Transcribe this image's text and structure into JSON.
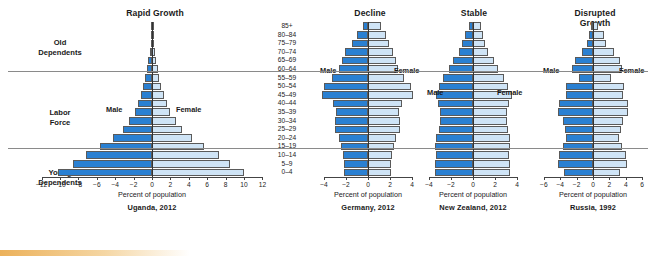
{
  "figure": {
    "axis_label": "Percent of population",
    "male_label": "Male",
    "female_label": "Female",
    "age_groups": [
      "85+",
      "80–84",
      "75–79",
      "70–74",
      "65–69",
      "60–64",
      "55–59",
      "50–54",
      "45–49",
      "40–44",
      "35–39",
      "30–34",
      "25–29",
      "20–24",
      "15–19",
      "10–14",
      "5–9",
      "0–4"
    ],
    "side_labels": [
      {
        "line1": "Old",
        "line2": "Dependents"
      },
      {
        "line1": "Labor",
        "line2": "Force"
      },
      {
        "line1": "Young",
        "line2": "Dependents"
      }
    ],
    "colors": {
      "male": "#2a80d2",
      "female": "#cfe4f6",
      "outline": "#5a5a5a",
      "divider": "#8a8a8a"
    }
  },
  "chart_data": [
    {
      "type": "bar",
      "title": "Rapid Growth",
      "caption": "Uganda, 2012",
      "xlabel": "Percent of population",
      "ylabel": "",
      "xlim": [
        -12,
        12
      ],
      "xticks": [
        -12,
        -10,
        -8,
        -6,
        -4,
        -2,
        0,
        2,
        4,
        6,
        8,
        10,
        12
      ],
      "ticklabels": [
        "−12",
        "−10",
        "−8",
        "−6",
        "−4",
        "−2",
        "0",
        "2",
        "4",
        "6",
        "8",
        "10",
        "12"
      ],
      "categories": [
        "85+",
        "80–84",
        "75–79",
        "70–74",
        "65–69",
        "60–64",
        "55–59",
        "50–54",
        "45–49",
        "40–44",
        "35–39",
        "30–34",
        "25–29",
        "20–24",
        "15–19",
        "10–14",
        "5–9",
        "0–4"
      ],
      "series": [
        {
          "name": "Male",
          "values": [
            0.05,
            0.1,
            0.15,
            0.25,
            0.4,
            0.55,
            0.75,
            0.95,
            1.2,
            1.5,
            1.9,
            2.5,
            3.2,
            4.2,
            5.6,
            7.2,
            8.6,
            10.2
          ]
        },
        {
          "name": "Female",
          "values": [
            0.05,
            0.12,
            0.18,
            0.3,
            0.45,
            0.6,
            0.8,
            1.0,
            1.3,
            1.6,
            2.0,
            2.6,
            3.3,
            4.3,
            5.7,
            7.3,
            8.5,
            10.0
          ]
        }
      ],
      "legend": [
        "Male",
        "Female"
      ]
    },
    {
      "type": "bar",
      "title": "Decline",
      "caption": "Germany, 2012",
      "xlabel": "Percent of population",
      "ylabel": "",
      "xlim": [
        -4,
        4
      ],
      "xticks": [
        -4,
        -2,
        0,
        2,
        4
      ],
      "ticklabels": [
        "−4",
        "−2",
        "0",
        "2",
        "4"
      ],
      "categories": [
        "85+",
        "80–84",
        "75–79",
        "70–74",
        "65–69",
        "60–64",
        "55–59",
        "50–54",
        "45–49",
        "40–44",
        "35–39",
        "30–34",
        "25–29",
        "20–24",
        "15–19",
        "10–14",
        "5–9",
        "0–4"
      ],
      "series": [
        {
          "name": "Male",
          "values": [
            0.5,
            1.0,
            1.5,
            2.1,
            2.4,
            2.6,
            3.3,
            4.0,
            4.2,
            3.2,
            2.9,
            3.0,
            3.0,
            2.6,
            2.5,
            2.3,
            2.2,
            2.2
          ]
        },
        {
          "name": "Female",
          "values": [
            1.2,
            1.6,
            1.9,
            2.3,
            2.5,
            2.7,
            3.3,
            3.9,
            4.1,
            3.1,
            2.8,
            2.9,
            2.9,
            2.5,
            2.4,
            2.2,
            2.1,
            2.1
          ]
        }
      ],
      "legend": [
        "Male",
        "Female"
      ]
    },
    {
      "type": "bar",
      "title": "Stable",
      "caption": "New Zealand, 2012",
      "xlabel": "Percent of population",
      "ylabel": "",
      "xlim": [
        -4,
        4
      ],
      "xticks": [
        -4,
        -2,
        0,
        2,
        4
      ],
      "ticklabels": [
        "−4",
        "−2",
        "0",
        "2",
        "4"
      ],
      "categories": [
        "85+",
        "80–84",
        "75–79",
        "70–74",
        "65–69",
        "60–64",
        "55–59",
        "50–54",
        "45–49",
        "40–44",
        "35–39",
        "30–34",
        "25–29",
        "20–24",
        "15–19",
        "10–14",
        "5–9",
        "0–4"
      ],
      "series": [
        {
          "name": "Male",
          "values": [
            0.4,
            0.7,
            1.0,
            1.3,
            1.8,
            2.2,
            2.7,
            3.1,
            3.4,
            3.2,
            3.0,
            3.0,
            3.1,
            3.4,
            3.5,
            3.4,
            3.5,
            3.5
          ]
        },
        {
          "name": "Female",
          "values": [
            0.7,
            0.9,
            1.1,
            1.4,
            1.9,
            2.3,
            2.8,
            3.2,
            3.5,
            3.3,
            3.1,
            3.1,
            3.2,
            3.4,
            3.4,
            3.3,
            3.4,
            3.4
          ]
        }
      ],
      "legend": [
        "Male",
        "Female"
      ]
    },
    {
      "type": "bar",
      "title": "Disrupted Growth",
      "caption": "Russia, 1992",
      "xlabel": "Percent of population",
      "ylabel": "",
      "xlim": [
        -6,
        6
      ],
      "xticks": [
        -6,
        -4,
        -2,
        0,
        2,
        4,
        6
      ],
      "ticklabels": [
        "−6",
        "−4",
        "−2",
        "0",
        "2",
        "4",
        "6"
      ],
      "categories": [
        "85+",
        "80–84",
        "75–79",
        "70–74",
        "65–69",
        "60–64",
        "55–59",
        "50–54",
        "45–49",
        "40–44",
        "35–39",
        "30–34",
        "25–29",
        "20–24",
        "15–19",
        "10–14",
        "5–9",
        "0–4"
      ],
      "series": [
        {
          "name": "Male",
          "values": [
            0.2,
            0.5,
            0.7,
            1.4,
            2.2,
            2.6,
            1.7,
            3.3,
            3.3,
            4.2,
            4.3,
            3.6,
            3.4,
            3.3,
            3.6,
            4.2,
            4.3,
            3.5
          ]
        },
        {
          "name": "Female",
          "values": [
            0.6,
            1.3,
            1.6,
            2.6,
            3.3,
            3.5,
            2.2,
            3.8,
            3.6,
            4.3,
            4.3,
            3.6,
            3.4,
            3.2,
            3.5,
            4.0,
            4.1,
            3.3
          ]
        }
      ],
      "legend": [
        "Male",
        "Female"
      ]
    }
  ],
  "layout": {
    "panels": [
      {
        "left": 22,
        "width": 243,
        "axis_x": 152,
        "scale": 9.2,
        "title_top": 8,
        "title_left": 110,
        "title_w": 90
      },
      {
        "left": 318,
        "width": 100,
        "axis_x": 368,
        "scale": 11.0,
        "title_top": 8,
        "title_left": 340,
        "title_w": 60
      },
      {
        "left": 422,
        "width": 102,
        "axis_x": 473,
        "scale": 11.0,
        "title_top": 8,
        "title_left": 444,
        "title_w": 60
      },
      {
        "left": 538,
        "width": 110,
        "axis_x": 593,
        "scale": 8.2,
        "title_top": 8,
        "title_left": 560,
        "title_w": 70
      }
    ],
    "plot_top": 22,
    "row_h": 8.6,
    "dividers_after_rows": [
      5,
      14
    ]
  }
}
